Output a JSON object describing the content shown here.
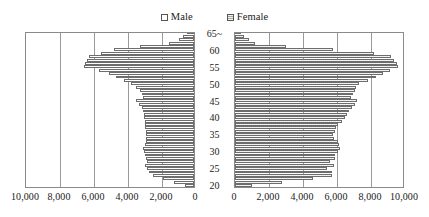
{
  "legend": {
    "position": "top-center",
    "entries": [
      {
        "label": "Male",
        "icon": "empty-square-swatch",
        "color": "#ffffff"
      },
      {
        "label": "Female",
        "icon": "hatched-square-swatch",
        "color": "#a6a69e"
      }
    ]
  },
  "axes": {
    "age_axis_label": "",
    "age_ticks": [
      "20",
      "25",
      "30",
      "35",
      "40",
      "45",
      "50",
      "55",
      "60",
      "65~"
    ],
    "value_ticks_left": [
      "10,000",
      "8,000",
      "6,000",
      "4,000",
      "2,000",
      "0"
    ],
    "value_ticks_right": [
      "0",
      "2,000",
      "4,000",
      "6,000",
      "8,000",
      "10,000"
    ],
    "value_max": 10000,
    "value_step": 2000,
    "grid": true
  },
  "chart_data": {
    "type": "bar",
    "subtype": "population-pyramid",
    "title": "",
    "subtitle": "",
    "xlabel": "",
    "ylabel": "",
    "xlim": [
      0,
      10000
    ],
    "ylim_categories": [
      "20",
      "65~"
    ],
    "grid": true,
    "legend_position": "top-center",
    "categories": [
      "20",
      "21",
      "22",
      "23",
      "24",
      "25",
      "26",
      "27",
      "28",
      "29",
      "30",
      "31",
      "32",
      "33",
      "34",
      "35",
      "36",
      "37",
      "38",
      "39",
      "40",
      "41",
      "42",
      "43",
      "44",
      "45",
      "46",
      "47",
      "48",
      "49",
      "50",
      "51",
      "52",
      "53",
      "54",
      "55",
      "56",
      "57",
      "58",
      "59",
      "60",
      "61",
      "62",
      "63",
      "64",
      "65~"
    ],
    "series": [
      {
        "name": "Male",
        "color": "#ffffff",
        "values": [
          520,
          1150,
          1800,
          2400,
          2650,
          2780,
          2880,
          2760,
          2820,
          2900,
          2960,
          3000,
          2900,
          2840,
          2820,
          2800,
          2840,
          2880,
          2900,
          2900,
          2940,
          2960,
          3000,
          3050,
          3250,
          3420,
          3000,
          3060,
          3200,
          3420,
          3700,
          4100,
          4560,
          5000,
          5600,
          6480,
          6420,
          6300,
          6150,
          5450,
          4680,
          3180,
          1450,
          900,
          620,
          430
        ]
      },
      {
        "name": "Female",
        "color": "#a6a69e",
        "values": [
          1000,
          2750,
          4600,
          5700,
          5680,
          5420,
          5800,
          5560,
          5860,
          5900,
          6060,
          6180,
          6120,
          6060,
          5800,
          5780,
          5860,
          5960,
          6060,
          6300,
          6480,
          6600,
          6720,
          6900,
          7060,
          7200,
          6820,
          6940,
          7060,
          7140,
          7300,
          7800,
          8300,
          8700,
          9100,
          9600,
          9500,
          9350,
          9150,
          8150,
          5760,
          3000,
          1200,
          800,
          520,
          360
        ]
      }
    ]
  }
}
